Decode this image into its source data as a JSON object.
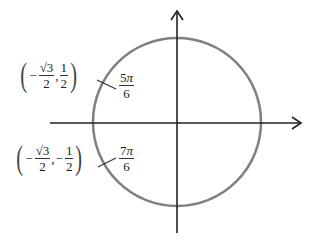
{
  "diagram": {
    "type": "unit-circle",
    "points": [
      {
        "angle_num": "5",
        "angle_sym": "π",
        "angle_den": "6",
        "x_sign": "−",
        "x_num": "√3",
        "x_den": "2",
        "y_sign": "",
        "y_num": "1",
        "y_den": "2"
      },
      {
        "angle_num": "7",
        "angle_sym": "π",
        "angle_den": "6",
        "x_sign": "−",
        "x_num": "√3",
        "x_den": "2",
        "y_sign": "−",
        "y_num": "1",
        "y_den": "2"
      }
    ],
    "comma": ",",
    "lparen": "(",
    "rparen": ")",
    "colors": {
      "circle": "#808080",
      "axes": "#222222"
    }
  }
}
